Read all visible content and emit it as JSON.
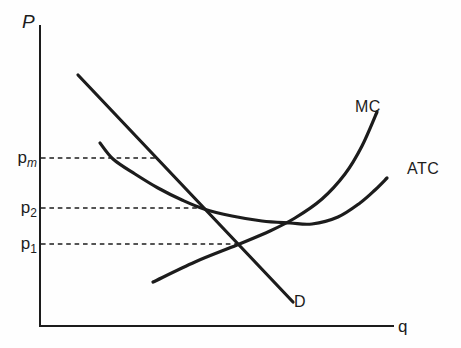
{
  "figure": {
    "width": 461,
    "height": 348,
    "background": "#fefefe",
    "ink": "#1c1c1c"
  },
  "axes": {
    "y_axis": {
      "label": "P",
      "x": 40,
      "top": 25,
      "label_pos": [
        22,
        12
      ]
    },
    "x_axis": {
      "label": "q",
      "y": 326,
      "left": 40,
      "right": 394,
      "label_pos": [
        398,
        318
      ]
    }
  },
  "chart_data": {
    "type": "line",
    "xlabel": "q",
    "ylabel": "P",
    "grid": false,
    "legend": "inline-curve-labels",
    "series": [
      {
        "name": "D",
        "shape": "straight-downward",
        "points_px": [
          [
            78,
            75
          ],
          [
            293,
            302
          ]
        ],
        "label_pos": [
          294,
          294
        ]
      },
      {
        "name": "ATC",
        "shape": "u-curve",
        "points_px": [
          [
            100,
            143
          ],
          [
            113,
            159
          ],
          [
            135,
            174
          ],
          [
            158,
            188
          ],
          [
            182,
            200
          ],
          [
            204,
            209
          ],
          [
            232,
            216
          ],
          [
            262,
            221
          ],
          [
            290,
            223
          ],
          [
            312,
            224
          ],
          [
            338,
            217
          ],
          [
            360,
            203
          ],
          [
            375,
            190
          ],
          [
            387,
            178
          ]
        ],
        "label_pos": [
          407,
          161
        ]
      },
      {
        "name": "MC",
        "shape": "convex-upward",
        "points_px": [
          [
            153,
            282
          ],
          [
            195,
            262
          ],
          [
            237,
            245
          ],
          [
            270,
            231
          ],
          [
            295,
            218
          ],
          [
            322,
            199
          ],
          [
            345,
            174
          ],
          [
            362,
            146
          ],
          [
            377,
            112
          ]
        ],
        "label_pos": [
          355,
          99
        ]
      }
    ],
    "price_lines": [
      {
        "base": "p",
        "sub": "m",
        "sub_italic": true,
        "y": 158,
        "x_end": 157
      },
      {
        "base": "p",
        "sub": "2",
        "sub_italic": false,
        "y": 208,
        "x_end": 203
      },
      {
        "base": "p",
        "sub": "1",
        "sub_italic": false,
        "y": 244,
        "x_end": 236
      }
    ]
  }
}
